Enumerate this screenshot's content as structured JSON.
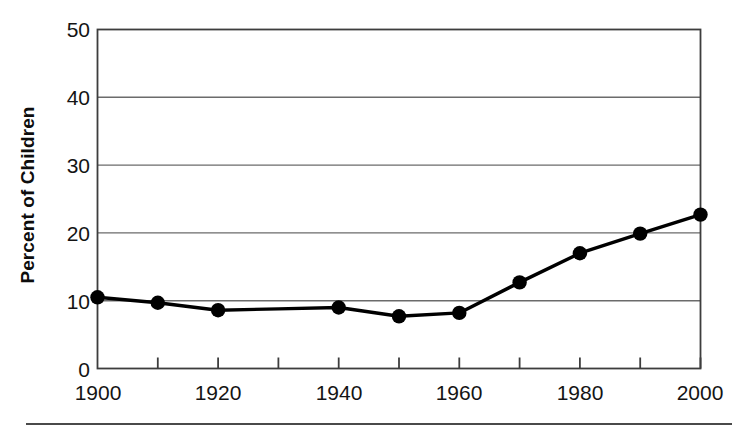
{
  "chart_data": {
    "type": "line",
    "title": "",
    "subtitle": "",
    "xlabel": "",
    "ylabel": "Percent of Children",
    "x": [
      1900,
      1910,
      1920,
      1930,
      1940,
      1950,
      1960,
      1970,
      1980,
      1990,
      2000
    ],
    "values": [
      10.5,
      9.7,
      8.6,
      8.8,
      9.0,
      7.7,
      8.2,
      12.7,
      17.0,
      19.9,
      22.7
    ],
    "series": [
      {
        "name": "Percent of Children",
        "values": [
          10.5,
          9.7,
          8.6,
          8.8,
          9.0,
          7.7,
          8.2,
          12.7,
          17.0,
          19.9,
          22.7
        ]
      }
    ],
    "markers": [
      {
        "x": 1900,
        "y": 10.5
      },
      {
        "x": 1910,
        "y": 9.7
      },
      {
        "x": 1920,
        "y": 8.6
      },
      {
        "x": 1940,
        "y": 9.0
      },
      {
        "x": 1950,
        "y": 7.7
      },
      {
        "x": 1960,
        "y": 8.2
      },
      {
        "x": 1970,
        "y": 12.7
      },
      {
        "x": 1980,
        "y": 17.0
      },
      {
        "x": 1990,
        "y": 19.9
      },
      {
        "x": 2000,
        "y": 22.7
      }
    ],
    "xlim": [
      1900,
      2000
    ],
    "ylim": [
      0,
      50
    ],
    "xticks": [
      1900,
      1910,
      1920,
      1930,
      1940,
      1950,
      1960,
      1970,
      1980,
      1990,
      2000
    ],
    "xticklabels": [
      "1900",
      "",
      "1920",
      "",
      "1940",
      "",
      "1960",
      "",
      "1980",
      "",
      "2000"
    ],
    "yticks": [
      0,
      10,
      20,
      30,
      40,
      50
    ],
    "yticklabels": [
      "0",
      "10",
      "20",
      "30",
      "40",
      "50"
    ],
    "grid": "horizontal",
    "legend": "none",
    "line_color": "#000000",
    "marker_color": "#000000",
    "grid_color": "#6b6b6b",
    "axis_color": "#3d3d3d",
    "background": "#ffffff"
  },
  "axes": {
    "y_title": "Percent of Children",
    "y_labels": [
      "50",
      "40",
      "30",
      "20",
      "10",
      "0"
    ],
    "x_labels": [
      "1900",
      "1920",
      "1940",
      "1960",
      "1980",
      "2000"
    ]
  },
  "figure": {
    "rule_label": "horizontal-rule"
  }
}
